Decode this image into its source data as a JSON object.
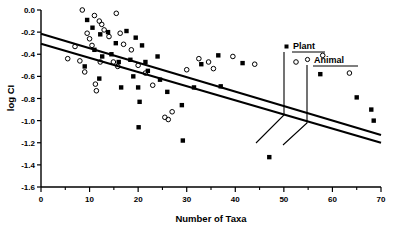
{
  "chart_data": {
    "type": "scatter",
    "title": "",
    "xlabel": "Number of Taxa",
    "ylabel": "log CI",
    "xlim": [
      0,
      70
    ],
    "ylim": [
      -1.6,
      0.0
    ],
    "xticks": [
      0,
      10,
      20,
      30,
      40,
      50,
      60,
      70
    ],
    "xtick_labels": [
      "0",
      "10",
      "20",
      "30",
      "40",
      "50",
      "60",
      "70"
    ],
    "xminor_step": 5,
    "yticks": [
      0.0,
      -0.2,
      -0.4,
      -0.6,
      -0.8,
      -1.0,
      -1.2,
      -1.4,
      -1.6
    ],
    "ytick_labels": [
      "0.0",
      "-0.2",
      "-0.4",
      "-0.6",
      "-0.8",
      "-1.0",
      "-1.2",
      "-1.4",
      "-1.6"
    ],
    "grid": false,
    "legend_position": "upper-right",
    "series": [
      {
        "name": "Plant",
        "marker": "filled-square",
        "color": "#000000",
        "points": [
          [
            9.5,
            -0.09
          ],
          [
            10.6,
            -0.16
          ],
          [
            12.2,
            -0.22
          ],
          [
            13.8,
            -0.2
          ],
          [
            15.4,
            -0.3
          ],
          [
            17.6,
            -0.19
          ],
          [
            19.5,
            -0.25
          ],
          [
            20.8,
            -0.32
          ],
          [
            11.0,
            -0.36
          ],
          [
            12.6,
            -0.42
          ],
          [
            14.5,
            -0.4
          ],
          [
            16.0,
            -0.47
          ],
          [
            9.0,
            -0.51
          ],
          [
            12.0,
            -0.62
          ],
          [
            18.4,
            -0.45
          ],
          [
            21.5,
            -0.47
          ],
          [
            24.0,
            -0.42
          ],
          [
            22.0,
            -0.55
          ],
          [
            19.0,
            -0.6
          ],
          [
            20.0,
            -0.7
          ],
          [
            20.3,
            -0.83
          ],
          [
            20.1,
            -1.06
          ],
          [
            16.5,
            -0.7
          ],
          [
            24.5,
            -0.63
          ],
          [
            26.0,
            -0.74
          ],
          [
            29.0,
            -0.86
          ],
          [
            29.2,
            -1.18
          ],
          [
            31.5,
            -0.7
          ],
          [
            33.0,
            -0.49
          ],
          [
            36.5,
            -0.41
          ],
          [
            37.0,
            -0.69
          ],
          [
            41.5,
            -0.48
          ],
          [
            47.0,
            -1.33
          ],
          [
            57.5,
            -0.58
          ],
          [
            65.0,
            -0.79
          ],
          [
            68.0,
            -0.9
          ],
          [
            68.5,
            -1.0
          ]
        ]
      },
      {
        "name": "Animal",
        "marker": "open-circle",
        "color": "#000000",
        "points": [
          [
            8.5,
            0.0
          ],
          [
            11.0,
            -0.05
          ],
          [
            12.0,
            -0.1
          ],
          [
            12.5,
            -0.13
          ],
          [
            15.5,
            -0.03
          ],
          [
            13.0,
            -0.18
          ],
          [
            9.5,
            -0.21
          ],
          [
            10.0,
            -0.26
          ],
          [
            14.0,
            -0.24
          ],
          [
            16.3,
            -0.21
          ],
          [
            7.0,
            -0.33
          ],
          [
            10.5,
            -0.32
          ],
          [
            17.0,
            -0.31
          ],
          [
            18.6,
            -0.36
          ],
          [
            5.5,
            -0.44
          ],
          [
            8.0,
            -0.46
          ],
          [
            12.2,
            -0.47
          ],
          [
            9.0,
            -0.56
          ],
          [
            15.8,
            -0.51
          ],
          [
            14.9,
            -0.47
          ],
          [
            11.2,
            -0.67
          ],
          [
            11.4,
            -0.73
          ],
          [
            20.0,
            -0.5
          ],
          [
            21.5,
            -0.57
          ],
          [
            23.0,
            -0.68
          ],
          [
            25.5,
            -0.97
          ],
          [
            26.2,
            -0.99
          ],
          [
            27.0,
            -0.92
          ],
          [
            30.0,
            -0.54
          ],
          [
            32.5,
            -0.44
          ],
          [
            34.5,
            -0.47
          ],
          [
            35.5,
            -0.53
          ],
          [
            39.5,
            -0.42
          ],
          [
            44.0,
            -0.49
          ],
          [
            52.5,
            -0.47
          ],
          [
            58.0,
            -0.41
          ],
          [
            63.5,
            -0.57
          ]
        ]
      }
    ],
    "fit_lines": [
      {
        "name": "Plant regression line",
        "x": [
          0,
          70
        ],
        "y": [
          -0.215,
          -1.13
        ]
      },
      {
        "name": "Animal regression line",
        "x": [
          0,
          70
        ],
        "y": [
          -0.305,
          -1.2
        ]
      }
    ]
  },
  "legend": {
    "items": [
      {
        "label": "Plant",
        "marker": "filled-square"
      },
      {
        "label": "Animal",
        "marker": "open-circle"
      }
    ]
  }
}
